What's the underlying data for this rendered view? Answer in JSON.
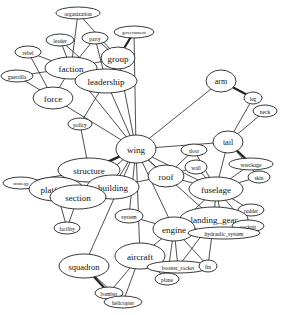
{
  "chart_data": {
    "type": "network",
    "title": "",
    "nodes": [
      {
        "id": "organization",
        "label": "organization",
        "x": 78,
        "y": 13,
        "rx": 22,
        "ry": 6,
        "fs": 5.5
      },
      {
        "id": "party",
        "label": "party",
        "x": 95,
        "y": 38,
        "rx": 13,
        "ry": 6,
        "fs": 5.5
      },
      {
        "id": "leader",
        "label": "leader",
        "x": 60,
        "y": 40,
        "rx": 14,
        "ry": 6,
        "fs": 5.5
      },
      {
        "id": "government",
        "label": "government",
        "x": 134,
        "y": 32,
        "rx": 20,
        "ry": 6,
        "fs": 5
      },
      {
        "id": "rebel",
        "label": "rebel",
        "x": 28,
        "y": 52,
        "rx": 13,
        "ry": 6,
        "fs": 5.5
      },
      {
        "id": "group",
        "label": "group",
        "x": 118,
        "y": 58,
        "rx": 17,
        "ry": 11,
        "fs": 9
      },
      {
        "id": "faction",
        "label": "faction",
        "x": 71,
        "y": 68,
        "rx": 26,
        "ry": 11,
        "fs": 9
      },
      {
        "id": "guerrilla",
        "label": "guerrilla",
        "x": 17,
        "y": 76,
        "rx": 16,
        "ry": 6,
        "fs": 5.5
      },
      {
        "id": "leadership",
        "label": "leadership",
        "x": 106,
        "y": 81,
        "rx": 31,
        "ry": 12,
        "fs": 9
      },
      {
        "id": "force",
        "label": "force",
        "x": 53,
        "y": 98,
        "rx": 20,
        "ry": 11,
        "fs": 9
      },
      {
        "id": "policy",
        "label": "policy",
        "x": 80,
        "y": 124,
        "rx": 12,
        "ry": 6,
        "fs": 5.5
      },
      {
        "id": "arm",
        "label": "arm",
        "x": 221,
        "y": 81,
        "rx": 15,
        "ry": 11,
        "fs": 8
      },
      {
        "id": "leg",
        "label": "leg",
        "x": 253,
        "y": 98,
        "rx": 9,
        "ry": 6,
        "fs": 5.5
      },
      {
        "id": "neck",
        "label": "neck",
        "x": 265,
        "y": 111,
        "rx": 12,
        "ry": 6,
        "fs": 5.5
      },
      {
        "id": "tail",
        "label": "tail",
        "x": 228,
        "y": 142,
        "rx": 15,
        "ry": 11,
        "fs": 8
      },
      {
        "id": "wing",
        "label": "wing",
        "x": 136,
        "y": 149,
        "rx": 20,
        "ry": 14,
        "fs": 9
      },
      {
        "id": "door",
        "label": "door",
        "x": 194,
        "y": 150,
        "rx": 13,
        "ry": 6,
        "fs": 5.5
      },
      {
        "id": "wall",
        "label": "wall",
        "x": 196,
        "y": 167,
        "rx": 11,
        "ry": 7,
        "fs": 5.5
      },
      {
        "id": "wreckage",
        "label": "wreckage",
        "x": 251,
        "y": 164,
        "rx": 22,
        "ry": 6,
        "fs": 5.5
      },
      {
        "id": "skin",
        "label": "skin",
        "x": 259,
        "y": 177,
        "rx": 11,
        "ry": 6,
        "fs": 5.5
      },
      {
        "id": "roof",
        "label": "roof",
        "x": 166,
        "y": 176,
        "rx": 18,
        "ry": 11,
        "fs": 9
      },
      {
        "id": "structure",
        "label": "structure",
        "x": 89,
        "y": 170,
        "rx": 31,
        "ry": 12,
        "fs": 9
      },
      {
        "id": "strategy",
        "label": "strategy",
        "x": 21,
        "y": 183,
        "rx": 18,
        "ry": 6,
        "fs": 5
      },
      {
        "id": "platform",
        "label": "platform",
        "x": 56,
        "y": 189,
        "rx": 27,
        "ry": 12,
        "fs": 9
      },
      {
        "id": "building",
        "label": "building",
        "x": 113,
        "y": 187,
        "rx": 26,
        "ry": 12,
        "fs": 9
      },
      {
        "id": "section",
        "label": "section",
        "x": 78,
        "y": 197,
        "rx": 28,
        "ry": 12,
        "fs": 9
      },
      {
        "id": "fuselage",
        "label": "fuselage",
        "x": 216,
        "y": 189,
        "rx": 27,
        "ry": 12,
        "fs": 9
      },
      {
        "id": "rudder",
        "label": "rudder",
        "x": 251,
        "y": 210,
        "rx": 13,
        "ry": 6,
        "fs": 5.5
      },
      {
        "id": "landing_gear",
        "label": "landing_gear",
        "x": 214,
        "y": 219,
        "rx": 34,
        "ry": 12,
        "fs": 9
      },
      {
        "id": "system",
        "label": "system",
        "x": 129,
        "y": 216,
        "rx": 14,
        "ry": 7,
        "fs": 5.5
      },
      {
        "id": "cockpit",
        "label": "cockpit",
        "x": 248,
        "y": 226,
        "rx": 16,
        "ry": 6,
        "fs": 5.5
      },
      {
        "id": "engine",
        "label": "engine",
        "x": 174,
        "y": 229,
        "rx": 21,
        "ry": 12,
        "fs": 9
      },
      {
        "id": "hydraulic_system",
        "label": "hydraulic_system",
        "x": 224,
        "y": 233,
        "rx": 36,
        "ry": 6,
        "fs": 5.5
      },
      {
        "id": "facility",
        "label": "facility",
        "x": 67,
        "y": 228,
        "rx": 13,
        "ry": 6,
        "fs": 5.5
      },
      {
        "id": "squadron",
        "label": "squadron",
        "x": 84,
        "y": 266,
        "rx": 25,
        "ry": 12,
        "fs": 8.5
      },
      {
        "id": "aircraft",
        "label": "aircraft",
        "x": 140,
        "y": 256,
        "rx": 25,
        "ry": 13,
        "fs": 9
      },
      {
        "id": "booster_rocket",
        "label": "booster_rocket",
        "x": 178,
        "y": 267,
        "rx": 31,
        "ry": 6,
        "fs": 5.5
      },
      {
        "id": "fin",
        "label": "fin",
        "x": 208,
        "y": 266,
        "rx": 9,
        "ry": 6,
        "fs": 5.5
      },
      {
        "id": "plane",
        "label": "plane",
        "x": 167,
        "y": 279,
        "rx": 12,
        "ry": 6,
        "fs": 5.5
      },
      {
        "id": "bomber",
        "label": "bomber",
        "x": 109,
        "y": 293,
        "rx": 14,
        "ry": 6,
        "fs": 5.5
      },
      {
        "id": "helicopter",
        "label": "helicopter",
        "x": 123,
        "y": 302,
        "rx": 19,
        "ry": 6,
        "fs": 5.5
      }
    ],
    "edges": [
      [
        "organization",
        "faction"
      ],
      [
        "organization",
        "group"
      ],
      [
        "party",
        "faction"
      ],
      [
        "party",
        "group"
      ],
      [
        "party",
        "leadership"
      ],
      [
        "leader",
        "faction"
      ],
      [
        "leader",
        "leadership"
      ],
      [
        "government",
        "group",
        "double"
      ],
      [
        "government",
        "wing"
      ],
      [
        "rebel",
        "faction"
      ],
      [
        "rebel",
        "force"
      ],
      [
        "guerrilla",
        "faction"
      ],
      [
        "guerrilla",
        "force"
      ],
      [
        "faction",
        "group"
      ],
      [
        "faction",
        "leadership"
      ],
      [
        "faction",
        "force"
      ],
      [
        "faction",
        "wing"
      ],
      [
        "group",
        "leadership"
      ],
      [
        "group",
        "wing"
      ],
      [
        "leadership",
        "wing"
      ],
      [
        "leadership",
        "policy"
      ],
      [
        "force",
        "wing"
      ],
      [
        "policy",
        "structure"
      ],
      [
        "arm",
        "leg",
        "double"
      ],
      [
        "arm",
        "wing"
      ],
      [
        "leg",
        "tail"
      ],
      [
        "neck",
        "tail"
      ],
      [
        "tail",
        "wing"
      ],
      [
        "tail",
        "fuselage"
      ],
      [
        "tail",
        "wreckage",
        "double"
      ],
      [
        "tail",
        "skin"
      ],
      [
        "wing",
        "structure",
        "double"
      ],
      [
        "wing",
        "platform"
      ],
      [
        "wing",
        "building"
      ],
      [
        "wing",
        "section"
      ],
      [
        "wing",
        "roof"
      ],
      [
        "wing",
        "fuselage"
      ],
      [
        "wing",
        "system"
      ],
      [
        "wing",
        "aircraft"
      ],
      [
        "wing",
        "engine"
      ],
      [
        "wing",
        "landing_gear"
      ],
      [
        "wing",
        "squadron"
      ],
      [
        "door",
        "roof"
      ],
      [
        "door",
        "fuselage"
      ],
      [
        "wall",
        "roof"
      ],
      [
        "wall",
        "fuselage"
      ],
      [
        "roof",
        "building"
      ],
      [
        "roof",
        "fuselage"
      ],
      [
        "fuselage",
        "skin"
      ],
      [
        "fuselage",
        "wreckage"
      ],
      [
        "fuselage",
        "rudder"
      ],
      [
        "fuselage",
        "engine"
      ],
      [
        "fuselage",
        "landing_gear"
      ],
      [
        "fuselage",
        "cockpit"
      ],
      [
        "fuselage",
        "hydraulic_system"
      ],
      [
        "structure",
        "strategy"
      ],
      [
        "structure",
        "platform"
      ],
      [
        "structure",
        "building"
      ],
      [
        "strategy",
        "platform"
      ],
      [
        "platform",
        "section"
      ],
      [
        "platform",
        "facility"
      ],
      [
        "section",
        "facility"
      ],
      [
        "section",
        "building"
      ],
      [
        "system",
        "engine"
      ],
      [
        "landing_gear",
        "engine"
      ],
      [
        "landing_gear",
        "hydraulic_system"
      ],
      [
        "landing_gear",
        "cockpit"
      ],
      [
        "landing_gear",
        "booster_rocket"
      ],
      [
        "landing_gear",
        "fin"
      ],
      [
        "engine",
        "aircraft"
      ],
      [
        "engine",
        "plane"
      ],
      [
        "engine",
        "booster_rocket"
      ],
      [
        "engine",
        "fin"
      ],
      [
        "aircraft",
        "plane"
      ],
      [
        "aircraft",
        "bomber"
      ],
      [
        "aircraft",
        "helicopter"
      ],
      [
        "squadron",
        "bomber",
        "double"
      ],
      [
        "squadron",
        "helicopter"
      ]
    ]
  }
}
